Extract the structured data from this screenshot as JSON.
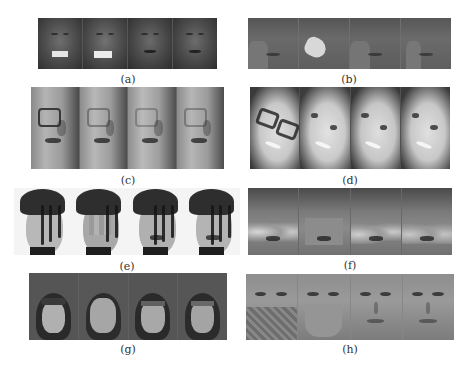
{
  "figure": {
    "panels": [
      {
        "id": "a",
        "caption": "(a)",
        "frames": 4,
        "subject": "dark-skinned male face, eyes closed",
        "occlusion": "white bar over mouth in frames 1-2"
      },
      {
        "id": "b",
        "caption": "(b)",
        "frames": 4,
        "subject": "low-contrast male face with hand near mouth",
        "occlusion": "light blob over hand/mouth in frame 2"
      },
      {
        "id": "c",
        "caption": "(c)",
        "frames": 4,
        "subject": "elderly man in profile wearing glasses",
        "occlusion": "glasses removed progressively"
      },
      {
        "id": "d",
        "caption": "(d)",
        "frames": 4,
        "subject": "smiling woman wearing glasses",
        "occlusion": "glasses removed progressively"
      },
      {
        "id": "e",
        "caption": "(e)",
        "frames": 4,
        "subject": "face with hair strands covering it",
        "occlusion": "hair over face, blocky reconstruction"
      },
      {
        "id": "f",
        "caption": "(f)",
        "frames": 4,
        "subject": "male face with hands over cheeks",
        "occlusion": "flat gray patch over lower face in frame 2"
      },
      {
        "id": "g",
        "caption": "(g)",
        "frames": 4,
        "subject": "face inside dark hood",
        "occlusion": "lighter patch over face in frame 2"
      },
      {
        "id": "h",
        "caption": "(h)",
        "frames": 4,
        "subject": "face with textured scarf over lower face",
        "occlusion": "flat gray patch over lower face in frame 2"
      }
    ]
  }
}
